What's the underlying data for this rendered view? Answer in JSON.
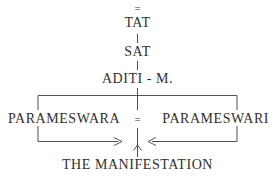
{
  "diagram": {
    "type": "hierarchical-tree",
    "background_color": "#ffffff",
    "line_color": "#555150",
    "text_color": "#332f2d",
    "nodes": {
      "equals_top": "=",
      "tat": "TAT",
      "sat": "SAT",
      "aditi": "ADITI - M.",
      "parameswara": "PARAMESWARA",
      "equals_middle": "=",
      "parameswari": "PARAMESWARI",
      "manifestation": "THE MANIFESTATION"
    },
    "connectors": {
      "tat_to_sat": "vertical-line",
      "sat_to_aditi": "vertical-line",
      "aditi_to_pair": "vertical-line",
      "pair_bracket": "horizontal-bracket-down",
      "lower_bracket": "horizontal-bracket-up",
      "left_arrow": "arrow-right-to-center",
      "right_arrow": "arrow-left-to-center",
      "manifestation_arrow": "arrow-up-to-center"
    }
  }
}
